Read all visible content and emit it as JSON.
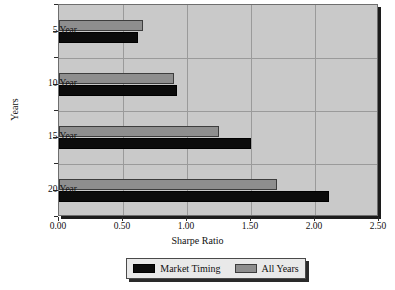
{
  "chart_data": {
    "type": "bar",
    "orientation": "horizontal",
    "title": "",
    "xlabel": "Sharpe Ratio",
    "ylabel": "Years",
    "categories": [
      "5 Year",
      "10 Year",
      "15 Year",
      "20 Year"
    ],
    "series": [
      {
        "name": "Market Timing",
        "color": "#0b0b0b",
        "values": [
          0.62,
          0.92,
          1.5,
          2.11
        ]
      },
      {
        "name": "All Years",
        "color": "#8e8e8e",
        "values": [
          0.66,
          0.9,
          1.25,
          1.7
        ]
      }
    ],
    "xlim": [
      0.0,
      2.5
    ],
    "xticks": [
      "0.00",
      "0.50",
      "1.00",
      "1.50",
      "2.00",
      "2.50"
    ],
    "xtick_values": [
      0.0,
      0.5,
      1.0,
      1.5,
      2.0,
      2.5
    ],
    "grid": true,
    "legend_position": "bottom",
    "plot_background": "#c9c9c9",
    "gridline_color": "#9a9a9a"
  }
}
